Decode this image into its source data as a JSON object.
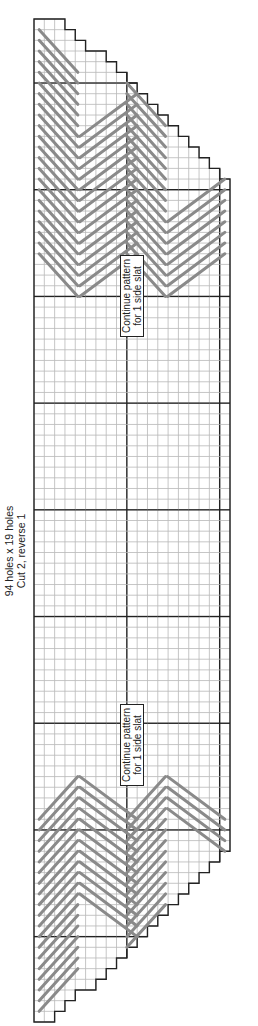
{
  "pattern": {
    "size_text": "94 holes x 19 holes",
    "cut_text": "Cut 2, reverse 1",
    "rows": 94,
    "cols": 19,
    "major_every": 10,
    "labels": [
      {
        "line1": "Continue pattern",
        "line2": "for 1 side slat",
        "x": 120,
        "y": 255
      },
      {
        "line1": "Continue pattern",
        "line2": "for 1 side slat",
        "x": 120,
        "y": 704
      }
    ],
    "top_profile_rows": [
      0,
      0,
      0,
      1,
      2,
      3,
      3,
      4,
      5,
      6,
      7,
      8,
      9,
      10,
      11,
      12,
      13,
      14,
      15
    ],
    "bottom_profile_rows": [
      94,
      94,
      93,
      92,
      91,
      91,
      90,
      89,
      88,
      87,
      86,
      85,
      84,
      83,
      82,
      81,
      80,
      79,
      78
    ],
    "stitch_top_end_row": 23,
    "stitch_bottom_start_row": 71,
    "chevron_peaks_cols": [
      0,
      8.5,
      17
    ],
    "colors": {
      "grid_minor": "#b8b8b8",
      "grid_major": "#222222",
      "stitch": "#8a8a8a",
      "outline": "#222222"
    }
  }
}
